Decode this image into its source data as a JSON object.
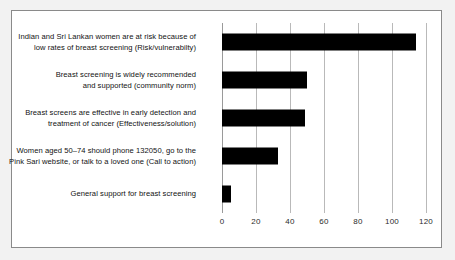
{
  "chart_data": {
    "type": "bar",
    "orientation": "horizontal",
    "title": "",
    "subtitle": "",
    "xlabel": "",
    "ylabel": "",
    "xlim": [
      0,
      130
    ],
    "xticks": [
      0,
      20,
      40,
      60,
      80,
      100,
      120
    ],
    "xtick_labels": [
      "0",
      "20",
      "40",
      "60",
      "80",
      "100",
      "120"
    ],
    "grid": true,
    "legend": false,
    "bar_color": "#000000",
    "gridline_color": "#b9b9b9",
    "frame_color": "#8a8a8a",
    "categories": [
      "Indian and  Sri Lankan women are at risk because of low rates of breast screening (Risk/vulnerabilty)",
      "Breast screening is widely recommended and supported (community norm)",
      "Breast screens are effective in early detection and treatment of cancer (Effectiveness/solution)",
      "Women aged 50–74 should phone 132050, go to the Pink Sari website, or talk to a loved one (Call to action)",
      "General support for breast screening"
    ],
    "category_lines": [
      [
        "Indian and  Sri Lankan women are at risk because of",
        "low rates of breast screening (Risk/vulnerabilty)"
      ],
      [
        "Breast screening is widely recommended",
        "and supported (community norm)"
      ],
      [
        "Breast screens are effective in early detection and",
        "treatment of cancer (Effectiveness/solution)"
      ],
      [
        "Women aged 50–74 should phone 132050, go to the",
        "Pink Sari website, or talk to a loved one (Call to action)"
      ],
      [
        "General support for breast screening"
      ]
    ],
    "values": [
      114,
      50,
      49,
      33,
      5
    ]
  }
}
